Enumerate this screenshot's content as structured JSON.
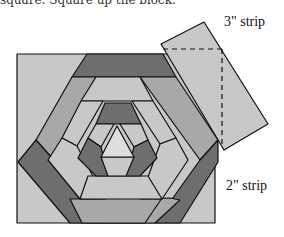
{
  "caption_fragment": "square. Square up the block.",
  "labels": {
    "strip_3": "3\" strip",
    "strip_2": "2\" strip"
  },
  "colors": {
    "light": "#c8c8c8",
    "lighter": "#dedede",
    "mid": "#a8a8a8",
    "dark": "#6e6e6e",
    "outline": "#111111",
    "background": "#ffffff"
  },
  "diagram": {
    "block_square": {
      "x": 17,
      "y": 54,
      "width": 198,
      "height": 169
    },
    "strip_3in": {
      "points": "161,44 204,22 268,124 224,150",
      "dashed_lines": [
        "163,49 222,49",
        "222,49 222,148"
      ]
    }
  }
}
